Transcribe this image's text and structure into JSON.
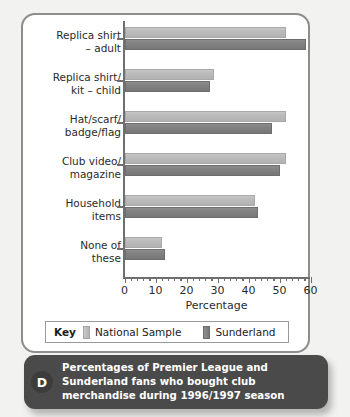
{
  "chart_data": {
    "type": "bar",
    "orientation": "horizontal",
    "title": "",
    "xlabel": "Percentage",
    "ylabel": "",
    "xlim": [
      0,
      60
    ],
    "xticks": [
      0,
      10,
      20,
      30,
      40,
      50,
      60
    ],
    "xtick_labels": [
      "0",
      "10",
      "20",
      "30",
      "40",
      "50",
      "60"
    ],
    "minor_tick_step": 2,
    "grid": false,
    "legend_position": "bottom",
    "categories": [
      "Replica shirt\n– adult",
      "Replica shirt/\nkit – child",
      "Hat/scarf/\nbadge/flag",
      "Club video/\nmagazine",
      "Household\nitems",
      "None of\nthese"
    ],
    "series": [
      {
        "name": "National Sample",
        "color": "#b8b8b8",
        "values": [
          52,
          29,
          52,
          52,
          42,
          12
        ]
      },
      {
        "name": "Sunderland",
        "color": "#808080",
        "values": [
          58.5,
          27.5,
          47.5,
          50,
          43,
          13
        ]
      }
    ]
  },
  "axis": {
    "x_title": "Percentage",
    "tick_labels": [
      "0",
      "10",
      "20",
      "30",
      "40",
      "50",
      "60"
    ]
  },
  "categories": [
    {
      "line1": "Replica shirt",
      "line2": "– adult"
    },
    {
      "line1": "Replica shirt/",
      "line2": "kit – child"
    },
    {
      "line1": "Hat/scarf/",
      "line2": "badge/flag"
    },
    {
      "line1": "Club video/",
      "line2": "magazine"
    },
    {
      "line1": "Household",
      "line2": "items"
    },
    {
      "line1": "None of",
      "line2": "these"
    }
  ],
  "legend": {
    "key_label": "Key",
    "entries": [
      {
        "label": "National Sample",
        "color": "#b8b8b8"
      },
      {
        "label": "Sunderland",
        "color": "#808080"
      }
    ]
  },
  "caption": {
    "badge": "D",
    "text": "Percentages of Premier League and Sunderland fans who bought club merchandise during 1996/1997 season"
  }
}
